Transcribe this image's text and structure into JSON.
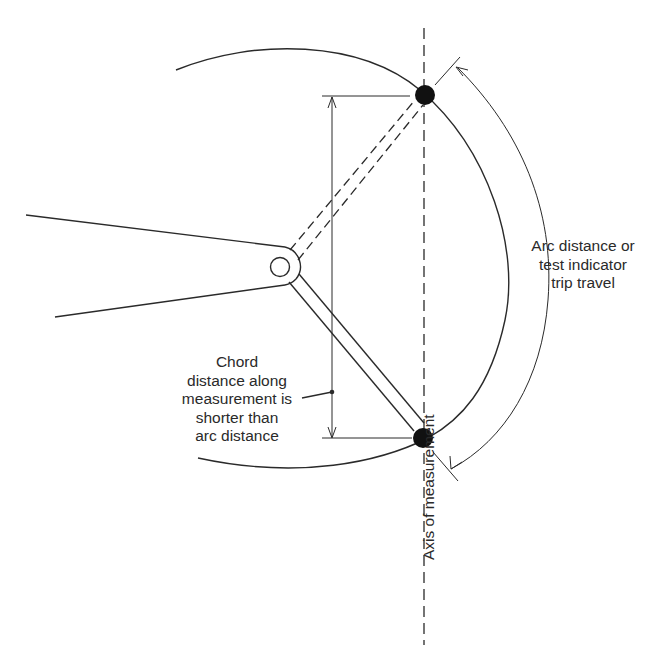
{
  "figure": {
    "labels": {
      "arc_distance": [
        "Arc distance or",
        "test indicator",
        "trip travel"
      ],
      "chord_distance": [
        "Chord",
        "distance along",
        "measurement is",
        "shorter than",
        "arc distance"
      ],
      "axis": "Axis of measurement"
    },
    "colors": {
      "line": "#2a2a2a",
      "background": "#ffffff",
      "contact_point": "#111111"
    },
    "elements": {
      "pivot": "pivot-hole",
      "contact_points": [
        "top-contact-point",
        "bottom-contact-point"
      ],
      "arm_positions": [
        "dashed-upper-arm-position",
        "solid-lower-arm-position"
      ]
    }
  }
}
